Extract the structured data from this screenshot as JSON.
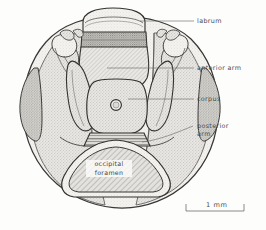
{
  "figure": {
    "background_color": "#fdfdfc",
    "ink_color": "#3a3a3a",
    "label_color": "#4c4c4c"
  },
  "labels": [
    {
      "id": "labrum",
      "text": "labrum",
      "lines": [
        "labrum"
      ]
    },
    {
      "id": "anterior",
      "text": "anterior  arm",
      "lines": [
        "anterior  arm"
      ]
    },
    {
      "id": "corpus",
      "text": "corpus",
      "lines": [
        "corpus"
      ]
    },
    {
      "id": "posterior",
      "text": "posterior arm",
      "lines": [
        "posterior",
        "arm"
      ]
    }
  ],
  "internal_labels": [
    {
      "id": "occipital-foramen",
      "line1": "occipital",
      "line2": "foramen"
    }
  ],
  "scale_bar": {
    "value": "1",
    "unit": "mm",
    "text": "1   mm"
  }
}
